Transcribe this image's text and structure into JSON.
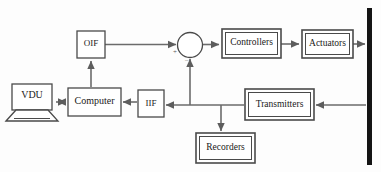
{
  "diagram": {
    "background_color": "#fdfdfd",
    "line_color": "#6b6b6b",
    "box_stroke_color": "#4a4a4a",
    "text_color": "#1a1a1a",
    "process_bar_color": "#141414",
    "blocks": [
      {
        "id": "vdu",
        "label": "VDU",
        "shape": "monitor",
        "x": 10,
        "y": 84,
        "w": 44,
        "h": 28
      },
      {
        "id": "computer",
        "label": "Computer",
        "shape": "single-box",
        "x": 68,
        "y": 88,
        "w": 52,
        "h": 28
      },
      {
        "id": "oif",
        "label": "OIF",
        "shape": "single-box",
        "x": 77,
        "y": 31,
        "w": 28,
        "h": 27
      },
      {
        "id": "iif",
        "label": "IIF",
        "shape": "single-box",
        "x": 138,
        "y": 90,
        "w": 25,
        "h": 27
      },
      {
        "id": "controllers",
        "label": "Controllers",
        "shape": "double-box",
        "x": 222,
        "y": 29,
        "w": 58,
        "h": 28
      },
      {
        "id": "actuators",
        "label": "Actuators",
        "shape": "double-box",
        "x": 302,
        "y": 30,
        "w": 50,
        "h": 27
      },
      {
        "id": "transmitters",
        "label": "Transmitters",
        "shape": "double-box",
        "x": 245,
        "y": 89,
        "w": 68,
        "h": 30
      },
      {
        "id": "recorders",
        "label": "Recorders",
        "shape": "double-box",
        "x": 196,
        "y": 133,
        "w": 58,
        "h": 29
      }
    ],
    "summing_junction": {
      "id": "summing-junction",
      "cx": 190,
      "cy": 45,
      "r": 12,
      "plus_sign": "+",
      "minus_sign": "–"
    },
    "process_bar": {
      "id": "process-boundary",
      "x": 367,
      "y": 8,
      "w": 5,
      "h": 157
    },
    "signal_paths": [
      {
        "id": "computer-to-vdu",
        "from": "computer",
        "to": "vdu",
        "direction": "left"
      },
      {
        "id": "vdu-to-computer",
        "from": "vdu",
        "to": "computer",
        "direction": "right"
      },
      {
        "id": "computer-to-oif",
        "from": "computer",
        "to": "oif",
        "direction": "up"
      },
      {
        "id": "oif-to-summing-junction",
        "from": "oif",
        "to": "summing-junction",
        "direction": "right"
      },
      {
        "id": "summing-to-controllers",
        "from": "summing-junction",
        "to": "controllers",
        "direction": "right"
      },
      {
        "id": "controllers-to-actuators",
        "from": "controllers",
        "to": "actuators",
        "direction": "right"
      },
      {
        "id": "actuators-to-process",
        "from": "actuators",
        "to": "process-boundary",
        "direction": "right"
      },
      {
        "id": "process-to-transmitters",
        "from": "process-boundary",
        "to": "transmitters",
        "direction": "left"
      },
      {
        "id": "transmitters-to-bus",
        "from": "transmitters",
        "to": "feedback-bus",
        "direction": "left"
      },
      {
        "id": "bus-to-summing-junction",
        "from": "feedback-bus",
        "to": "summing-junction",
        "direction": "up"
      },
      {
        "id": "bus-to-recorders",
        "from": "feedback-bus",
        "to": "recorders",
        "direction": "down"
      },
      {
        "id": "bus-to-iif",
        "from": "feedback-bus",
        "to": "iif",
        "direction": "left"
      },
      {
        "id": "iif-to-computer",
        "from": "iif",
        "to": "computer",
        "direction": "left"
      }
    ]
  }
}
